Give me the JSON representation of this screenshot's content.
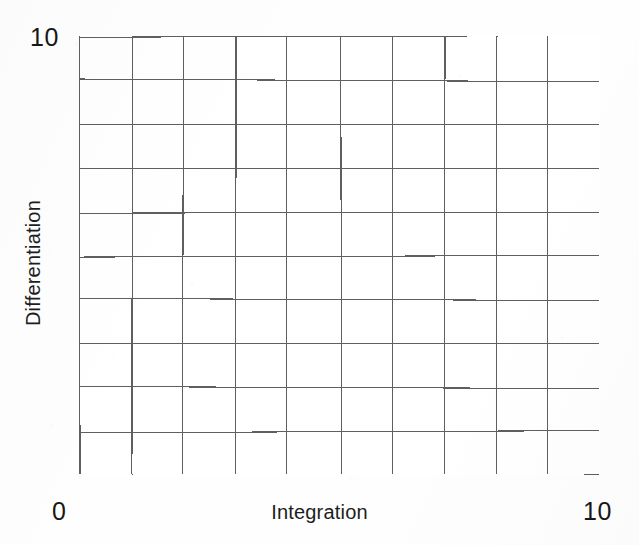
{
  "figure": {
    "background_color": "#fefefe",
    "plot_background_color": "#ffffff",
    "grid_line_color": "#5f5f5f",
    "text_color": "#1a1a1a"
  },
  "labels": {
    "y_axis_title": "Differentiation",
    "y_axis_max": "10",
    "x_axis_title": "Integration",
    "x_axis_min": "0",
    "x_axis_max": "10"
  },
  "chart_data": {
    "type": "scatter",
    "title": "",
    "subtitle": "",
    "xlabel": "Integration",
    "ylabel": "Differentiation",
    "xlim": [
      0,
      10
    ],
    "ylim": [
      0,
      10
    ],
    "xticks": [
      0,
      1,
      2,
      3,
      4,
      5,
      6,
      7,
      8,
      9,
      10
    ],
    "yticks": [
      0,
      1,
      2,
      3,
      4,
      5,
      6,
      7,
      8,
      9,
      10
    ],
    "xtick_labels": [
      "0",
      "",
      "",
      "",
      "",
      "",
      "",
      "",
      "",
      "",
      "10"
    ],
    "ytick_labels": [
      "",
      "",
      "",
      "",
      "",
      "",
      "",
      "",
      "",
      "",
      "10"
    ],
    "grid": true,
    "grid_columns": 10,
    "grid_rows": 10,
    "legend": null,
    "legend_position": "none",
    "annotations": [],
    "series": [],
    "x": [],
    "y": [],
    "note": "Empty 10x10 plotting grid; no data points are plotted."
  }
}
